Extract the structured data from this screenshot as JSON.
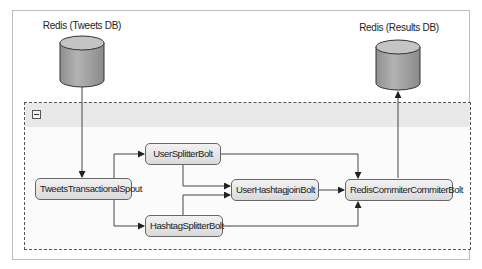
{
  "diagram": {
    "databases": [
      {
        "id": "tweets_db",
        "label": "Redis (Tweets DB)"
      },
      {
        "id": "results_db",
        "label": "Redis (Results DB)"
      }
    ],
    "container": {
      "collapse_icon": "minus-box-icon"
    },
    "nodes": [
      {
        "id": "spout",
        "label": "TweetsTransactionalSpout"
      },
      {
        "id": "user_splitter",
        "label": "UserSplitterBolt"
      },
      {
        "id": "hashtag_splitter",
        "label": "HashtagSplitterBolt"
      },
      {
        "id": "join",
        "label": "UserHashtagjoinBolt"
      },
      {
        "id": "committer",
        "label": "RedisCommiterCommiterBolt"
      }
    ],
    "edges": [
      {
        "from": "tweets_db",
        "to": "spout"
      },
      {
        "from": "spout",
        "to": "user_splitter"
      },
      {
        "from": "spout",
        "to": "hashtag_splitter"
      },
      {
        "from": "user_splitter",
        "to": "join"
      },
      {
        "from": "hashtag_splitter",
        "to": "join"
      },
      {
        "from": "user_splitter",
        "to": "committer"
      },
      {
        "from": "hashtag_splitter",
        "to": "committer"
      },
      {
        "from": "join",
        "to": "committer"
      },
      {
        "from": "committer",
        "to": "results_db"
      }
    ],
    "colors": {
      "cylinder": "#a8a8a8",
      "node_fill": "#e6e6e6",
      "line": "#444444"
    }
  }
}
